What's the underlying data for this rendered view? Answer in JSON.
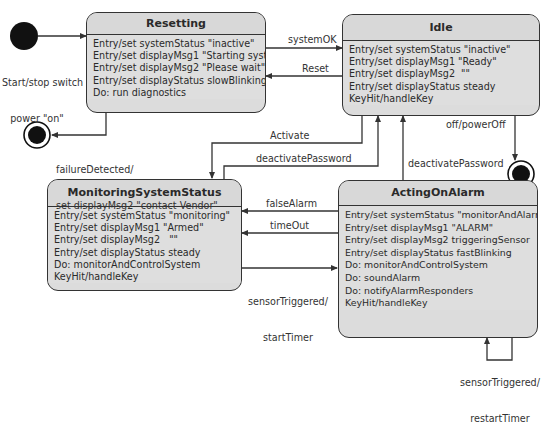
{
  "diagram": {
    "type": "UML state machine",
    "colors": {
      "state_fill": "#dcdcdc",
      "line": "#333333",
      "background": "#ffffff"
    },
    "initial_state": {
      "label_line1": "Start/stop switch",
      "label_line2": "power \"on\""
    },
    "states": {
      "resetting": {
        "name": "Resetting",
        "actions": [
          "Entry/set systemStatus \"inactive\"",
          "Entry/set displayMsg1 \"Starting system\"",
          "Entry/set displayMsg2 \"Please wait\"",
          "Entry/set displayStatus slowBlinking",
          "Do: run diagnostics"
        ]
      },
      "idle": {
        "name": "Idle",
        "actions": [
          "Entry/set systemStatus \"inactive\"",
          "Entry/set displayMsg1 \"Ready\"",
          "Entry/set displayMsg2  \"\"",
          "Entry/set displayStatus steady",
          "KeyHit/handleKey"
        ]
      },
      "monitoring": {
        "name": "MonitoringSystemStatus",
        "actions": [
          "Entry/set systemStatus \"monitoring\"",
          "Entry/set displayMsg1 \"Armed\"",
          "Entry/set displayMsg2   \"\"",
          "Entry/set displayStatus steady",
          "Do: monitorAndControlSystem",
          "KeyHit/handleKey"
        ]
      },
      "acting": {
        "name": "ActingOnAlarm",
        "actions": [
          "Entry/set systemStatus \"monitorAndAlarm\"",
          "Entry/set displayMsg1 \"ALARM\"",
          "Entry/set displayMsg2 triggeringSensor",
          "Entry/set displayStatus fastBlinking",
          "Do: monitorAndControlSystem",
          "Do: soundAlarm",
          "Do: notifyAlarmResponders",
          "KeyHit/handleKey"
        ]
      }
    },
    "transitions": {
      "system_ok": "systemOK",
      "reset": "Reset",
      "failure_line1": "failureDetected/",
      "failure_line2": "set displayMsg2 \"contact Vendor\"",
      "activate": "Activate",
      "deactivate_from_monitoring": "deactivatePassword",
      "deactivate_from_acting": "deactivatePassword",
      "power_off": "off/powerOff",
      "false_alarm": "falseAlarm",
      "time_out": "timeOut",
      "sensor_triggered_line1": "sensorTriggered/",
      "sensor_triggered_line2": "startTimer",
      "self_sensor_line1": "sensorTriggered/",
      "self_sensor_line2": "restartTimer"
    }
  }
}
